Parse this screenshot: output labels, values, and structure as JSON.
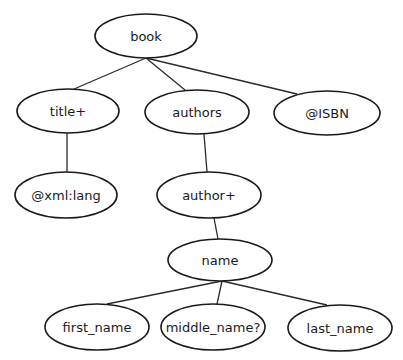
{
  "diagram": {
    "type": "tree",
    "colors": {
      "stroke": "#1a1a1a",
      "fill": "#ffffff",
      "text": "#1a1a1a"
    },
    "nodes": [
      {
        "id": "book",
        "label": "book",
        "cx": 146,
        "cy": 36,
        "rx": 51,
        "ry": 22
      },
      {
        "id": "title",
        "label": "title+",
        "cx": 68,
        "cy": 111,
        "rx": 51,
        "ry": 22
      },
      {
        "id": "authors",
        "label": "authors",
        "cx": 197,
        "cy": 112,
        "rx": 52,
        "ry": 22
      },
      {
        "id": "isbn",
        "label": "@ISBN",
        "cx": 327,
        "cy": 113,
        "rx": 53,
        "ry": 22
      },
      {
        "id": "xml_lang",
        "label": "@xml:lang",
        "cx": 66,
        "cy": 195,
        "rx": 51,
        "ry": 23
      },
      {
        "id": "author",
        "label": "author+",
        "cx": 209,
        "cy": 195,
        "rx": 52,
        "ry": 23
      },
      {
        "id": "name",
        "label": "name",
        "cx": 220,
        "cy": 260,
        "rx": 52,
        "ry": 21
      },
      {
        "id": "first_name",
        "label": "first_name",
        "cx": 97,
        "cy": 327,
        "rx": 52,
        "ry": 23
      },
      {
        "id": "middle_name",
        "label": "middle_name?",
        "cx": 213,
        "cy": 327,
        "rx": 52,
        "ry": 23
      },
      {
        "id": "last_name",
        "label": "last_name",
        "cx": 340,
        "cy": 328,
        "rx": 52,
        "ry": 23
      }
    ],
    "edges": [
      {
        "from": "book",
        "to": "title",
        "x1": 146,
        "y1": 58,
        "x2": 74,
        "y2": 89
      },
      {
        "from": "book",
        "to": "authors",
        "x1": 146,
        "y1": 58,
        "x2": 185,
        "y2": 90
      },
      {
        "from": "book",
        "to": "isbn",
        "x1": 146,
        "y1": 58,
        "x2": 297,
        "y2": 94
      },
      {
        "from": "title",
        "to": "xml_lang",
        "x1": 67,
        "y1": 133,
        "x2": 67,
        "y2": 172
      },
      {
        "from": "authors",
        "to": "author",
        "x1": 204,
        "y1": 134,
        "x2": 207,
        "y2": 172
      },
      {
        "from": "author",
        "to": "name",
        "x1": 214,
        "y1": 218,
        "x2": 218,
        "y2": 239
      },
      {
        "from": "name",
        "to": "first_name",
        "x1": 222,
        "y1": 281,
        "x2": 107,
        "y2": 304
      },
      {
        "from": "name",
        "to": "middle_name",
        "x1": 222,
        "y1": 281,
        "x2": 217,
        "y2": 304
      },
      {
        "from": "name",
        "to": "last_name",
        "x1": 222,
        "y1": 281,
        "x2": 327,
        "y2": 305
      }
    ]
  }
}
